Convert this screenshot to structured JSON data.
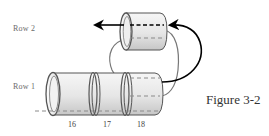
{
  "diagram": {
    "caption": "Figure 3-2",
    "row_labels": {
      "row2": "Row 2",
      "row1": "Row 1"
    },
    "cylinder_labels": [
      "16",
      "17",
      "18"
    ],
    "colors": {
      "outline": "#555555",
      "cylinder_fill_light": "#f4f4f4",
      "cylinder_fill_dark": "#c9c9c9",
      "arrow": "#000000",
      "thread_gray": "#777777",
      "dashed_gray": "#8a8a8a",
      "text": "#333333"
    }
  }
}
